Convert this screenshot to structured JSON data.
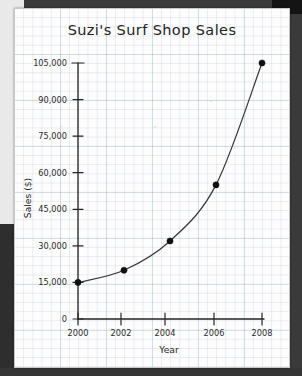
{
  "chart_data": {
    "type": "line",
    "title": "Suzi's Surf Shop Sales",
    "xlabel": "Year",
    "ylabel": "Sales ($)",
    "x": [
      2000,
      2002,
      2004,
      2006,
      2008
    ],
    "values": [
      15000,
      20000,
      32000,
      55000,
      105000
    ],
    "series": [
      {
        "name": "Sales",
        "values": [
          15000,
          20000,
          32000,
          55000,
          105000
        ]
      }
    ],
    "xtick_labels": [
      "2000",
      "2002",
      "2004",
      "2006",
      "2008"
    ],
    "ytick_labels": [
      "0",
      "15,000",
      "30,000",
      "45,000",
      "60,000",
      "75,000",
      "90,000",
      "105,000"
    ],
    "ytick_values": [
      0,
      15000,
      30000,
      45000,
      60000,
      75000,
      90000,
      105000
    ],
    "xlim": [
      1999.2,
      2008.8
    ],
    "ylim": [
      0,
      112000
    ],
    "grid": true,
    "legend": "none",
    "marker": "filled-circle",
    "line_color": "#3a3a3a",
    "marker_color": "#111111",
    "paper_color": "#fdfdfd",
    "grid_color": "#96a5be"
  },
  "labels": {
    "title": "Suzi's Surf Shop Sales",
    "y_axis_title": "Sales ($)",
    "x_axis_title": "Year",
    "y0": "0",
    "y1": "15,000",
    "y2": "30,000",
    "y3": "45,000",
    "y4": "60,000",
    "y5": "75,000",
    "y6": "90,000",
    "y7": "105,000",
    "x0": "2000",
    "x1": "2002",
    "x2": "2004",
    "x3": "2006",
    "x4": "2008"
  }
}
